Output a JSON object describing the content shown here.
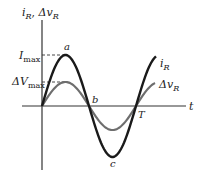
{
  "diagram": {
    "type": "sinusoid-phase-plot",
    "y_axis_label": {
      "main1": "i",
      "sub1": "R",
      "sep": ", ",
      "main2": "Δv",
      "sub2": "R"
    },
    "x_axis_label": "t",
    "levels": {
      "i_max": {
        "main": "I",
        "sub": "max"
      },
      "dv_max": {
        "main": "ΔV",
        "sub": "max"
      }
    },
    "points": {
      "a": "a",
      "b": "b",
      "c": "c",
      "T": "T"
    },
    "curves": [
      {
        "name": "i_R",
        "label_main": "i",
        "label_sub": "R",
        "color": "#1a1a1a",
        "amplitude_px": 51
      },
      {
        "name": "dv_R",
        "label_main": "Δv",
        "label_sub": "R",
        "color": "#6e6e6e",
        "amplitude_px": 24
      }
    ],
    "colors": {
      "axis": "#333333",
      "dash": "#333333"
    }
  }
}
